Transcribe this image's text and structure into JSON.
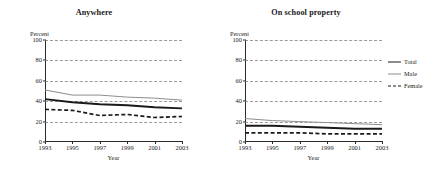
{
  "chart_data": [
    {
      "type": "line",
      "title": "Anywhere",
      "xlabel": "Year",
      "ylabel": "Percent",
      "ylim": [
        0,
        100
      ],
      "yticks": [
        0,
        20,
        40,
        60,
        80,
        100
      ],
      "xlim": [
        1993,
        2003
      ],
      "xticks": [
        1993,
        1995,
        1997,
        1999,
        2001,
        2003
      ],
      "x": [
        1993,
        1995,
        1997,
        1999,
        2001,
        2003
      ],
      "grid": "horizontal-dashed",
      "series": [
        {
          "name": "Total",
          "values": [
            42,
            39,
            37,
            36,
            34,
            33
          ]
        },
        {
          "name": "Male",
          "values": [
            51,
            46,
            46,
            44,
            43,
            41
          ]
        },
        {
          "name": "Female",
          "values": [
            32,
            31,
            26,
            27,
            24,
            25
          ]
        }
      ]
    },
    {
      "type": "line",
      "title": "On school property",
      "xlabel": "Year",
      "ylabel": "Percent",
      "ylim": [
        0,
        100
      ],
      "yticks": [
        0,
        20,
        40,
        60,
        80,
        100
      ],
      "xlim": [
        1993,
        2003
      ],
      "xticks": [
        1993,
        1995,
        1997,
        1999,
        2001,
        2003
      ],
      "x": [
        1993,
        1995,
        1997,
        1999,
        2001,
        2003
      ],
      "grid": "horizontal-dashed",
      "series": [
        {
          "name": "Total",
          "values": [
            16,
            16,
            15,
            14,
            13,
            13
          ]
        },
        {
          "name": "Male",
          "values": [
            23,
            21,
            20,
            19,
            18,
            17
          ]
        },
        {
          "name": "Female",
          "values": [
            9,
            9,
            9,
            8,
            8,
            8
          ]
        }
      ]
    }
  ],
  "legend": {
    "position": "right",
    "entries": [
      {
        "label": "Total",
        "style": "solid-thick-black"
      },
      {
        "label": "Male",
        "style": "solid-thin-gray"
      },
      {
        "label": "Female",
        "style": "dashed-black"
      }
    ]
  },
  "colors": {
    "total": "#1a1a1a",
    "male": "#8d8d8d",
    "female": "#1a1a1a",
    "grid": "#9a9a9a",
    "axis": "#2a2a2a",
    "background": "#ffffff"
  }
}
